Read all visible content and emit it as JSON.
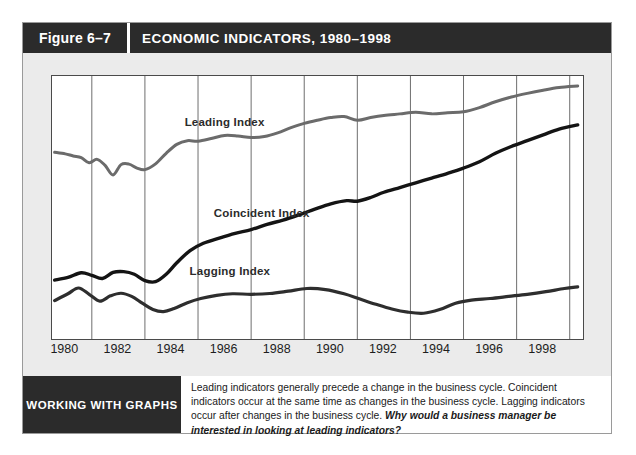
{
  "figure": {
    "number_label": "Figure 6–7",
    "title": "ECONOMIC INDICATORS, 1980–1998"
  },
  "footer": {
    "tag": "WORKING WITH GRAPHS",
    "caption": "Leading indicators generally precede a change in the business cycle. Coincident indicators occur at the same time as changes in the business cycle. Lagging indicators occur after changes in the business cycle. ",
    "question": "Why would a business manager be interested in looking at leading indicators?"
  },
  "colors": {
    "header_bar": "#2b2b2b",
    "panel_background": "#ebebeb",
    "plot_background": "#ffffff",
    "frame_border": "#4a4a4a",
    "gridline": "#6e6e6e",
    "leading_series": "#6b6b6b",
    "coincident_series": "#141414",
    "lagging_series": "#2e2e2e"
  },
  "chart_data": {
    "type": "line",
    "title": "ECONOMIC INDICATORS, 1980–1998",
    "xlabel": "",
    "ylabel": "",
    "xlim": [
      1979.5,
      1999.5
    ],
    "ylim": [
      0,
      100
    ],
    "grid": true,
    "grid_axis": "x",
    "legend_position": "inline-labels",
    "axis_ticks_shown": [
      "x"
    ],
    "y_axis_labeled": false,
    "xticks": [
      1980,
      1982,
      1984,
      1986,
      1988,
      1990,
      1992,
      1994,
      1996,
      1998
    ],
    "xtick_labels": [
      "1980",
      "1982",
      "1984",
      "1986",
      "1988",
      "1990",
      "1992",
      "1994",
      "1996",
      "1998"
    ],
    "gridline_years": [
      1981,
      1983,
      1985,
      1987,
      1989,
      1991,
      1993,
      1995,
      1997,
      1999
    ],
    "series": [
      {
        "name": "Leading Index",
        "color": "#6b6b6b",
        "width": 3.0,
        "label_position": {
          "x": 1986.0,
          "y": 82.0
        },
        "x": [
          1979.6,
          1980.0,
          1980.3,
          1980.6,
          1980.9,
          1981.2,
          1981.5,
          1981.8,
          1982.1,
          1982.4,
          1982.7,
          1983.0,
          1983.4,
          1983.8,
          1984.2,
          1984.6,
          1985.0,
          1985.5,
          1986.0,
          1986.5,
          1987.0,
          1987.5,
          1988.0,
          1988.5,
          1989.0,
          1989.5,
          1990.0,
          1990.5,
          1991.0,
          1991.5,
          1992.0,
          1992.6,
          1993.2,
          1993.8,
          1994.4,
          1995.0,
          1995.6,
          1996.2,
          1996.8,
          1997.4,
          1998.0,
          1998.6,
          1999.3
        ],
        "y": [
          71.0,
          70.4,
          69.6,
          69.0,
          67.0,
          68.3,
          66.0,
          62.4,
          66.3,
          66.5,
          65.0,
          64.4,
          66.6,
          70.6,
          74.0,
          75.4,
          75.2,
          76.2,
          77.4,
          77.2,
          76.6,
          77.0,
          78.4,
          80.4,
          82.0,
          83.2,
          84.2,
          84.6,
          83.2,
          84.2,
          85.0,
          85.6,
          86.2,
          85.6,
          86.0,
          86.4,
          88.0,
          90.2,
          92.0,
          93.4,
          94.6,
          95.6,
          96.2
        ]
      },
      {
        "name": "Coincident Index",
        "color": "#141414",
        "width": 3.4,
        "label_position": {
          "x": 1987.4,
          "y": 47.5
        },
        "x": [
          1979.6,
          1980.1,
          1980.6,
          1981.0,
          1981.4,
          1981.8,
          1982.2,
          1982.6,
          1983.0,
          1983.4,
          1983.8,
          1984.2,
          1984.7,
          1985.2,
          1985.8,
          1986.4,
          1987.0,
          1987.6,
          1988.2,
          1988.8,
          1989.4,
          1990.0,
          1990.6,
          1991.0,
          1991.5,
          1992.0,
          1992.6,
          1993.2,
          1993.8,
          1994.4,
          1995.0,
          1995.6,
          1996.2,
          1996.8,
          1997.4,
          1998.0,
          1998.6,
          1999.3
        ],
        "y": [
          22.4,
          23.4,
          25.2,
          24.2,
          23.0,
          25.3,
          25.6,
          24.6,
          22.2,
          21.8,
          24.6,
          29.0,
          33.6,
          36.4,
          38.4,
          40.2,
          41.6,
          43.6,
          45.2,
          47.2,
          49.4,
          51.4,
          52.6,
          52.4,
          53.8,
          55.8,
          57.6,
          59.4,
          61.2,
          63.0,
          65.0,
          67.4,
          70.6,
          73.2,
          75.4,
          77.6,
          79.8,
          81.4
        ]
      },
      {
        "name": "Lagging Index",
        "color": "#2e2e2e",
        "width": 3.2,
        "label_position": {
          "x": 1986.2,
          "y": 25.5
        },
        "x": [
          1979.6,
          1980.1,
          1980.5,
          1980.9,
          1981.3,
          1981.7,
          1982.1,
          1982.5,
          1982.9,
          1983.3,
          1983.7,
          1984.1,
          1984.6,
          1985.1,
          1985.7,
          1986.3,
          1987.0,
          1987.7,
          1988.4,
          1989.1,
          1989.8,
          1990.5,
          1991.1,
          1991.7,
          1992.3,
          1992.9,
          1993.5,
          1994.1,
          1994.7,
          1995.3,
          1996.0,
          1996.7,
          1997.4,
          1998.1,
          1998.8,
          1999.3
        ],
        "y": [
          14.6,
          17.2,
          19.4,
          17.0,
          14.4,
          16.4,
          17.4,
          16.2,
          13.6,
          11.2,
          10.4,
          11.6,
          13.8,
          15.4,
          16.6,
          17.2,
          17.0,
          17.3,
          18.2,
          19.2,
          18.8,
          17.2,
          15.2,
          13.2,
          11.4,
          10.2,
          9.8,
          11.2,
          13.6,
          14.8,
          15.4,
          16.2,
          17.0,
          18.0,
          19.2,
          19.8
        ]
      }
    ]
  }
}
